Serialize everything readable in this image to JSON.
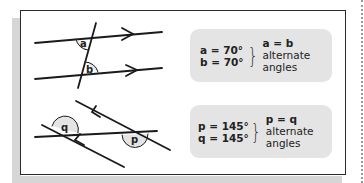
{
  "diagram": {
    "top": {
      "angle_labels": [
        "a",
        "b"
      ],
      "note": {
        "values": [
          "a = 70°",
          "b = 70°"
        ],
        "conclusion_eq": "a = b",
        "conclusion_lines": [
          "alternate",
          "angles"
        ]
      }
    },
    "bottom": {
      "angle_labels": [
        "q",
        "p"
      ],
      "note": {
        "values": [
          "p = 145°",
          "q = 145°"
        ],
        "conclusion_eq": "p = q",
        "conclusion_lines": [
          "alternate",
          "angles"
        ]
      }
    }
  },
  "colors": {
    "line": "#1a1a1a",
    "note_bg": "#e4e4e4",
    "shadow": "#d6d6d6",
    "frame": "#2a2a2a"
  }
}
